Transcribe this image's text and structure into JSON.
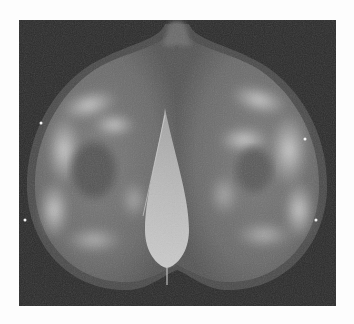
{
  "image": {
    "description": "Bilateral mammogram composite, grayscale X-ray",
    "alt": "Mammogram image showing two breasts mirrored with central pectoral muscle shadow"
  },
  "colors": {
    "page_background": "#fdfdfd",
    "frame_background": "#2b2b2b",
    "tissue_base": "#6e6e6e",
    "tissue_bright": "#d6d6d6",
    "muscle": "#c8c8c8",
    "marker": "#f4f4f4"
  },
  "markers": [
    {
      "side": "left",
      "position": "upper-outer"
    },
    {
      "side": "left",
      "position": "lower-outer"
    },
    {
      "side": "right",
      "position": "upper-outer"
    },
    {
      "side": "right",
      "position": "lower-outer"
    }
  ]
}
